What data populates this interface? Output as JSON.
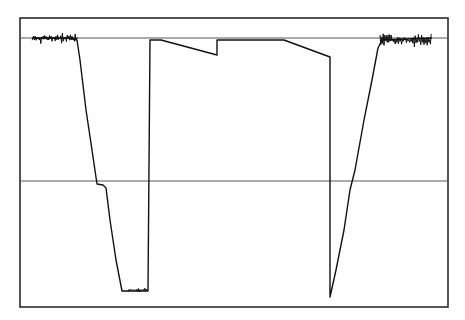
{
  "chart_data": {
    "type": "line",
    "title": "",
    "xlabel": "",
    "ylabel": "",
    "grid": false,
    "legend": null,
    "frame": {
      "left": 20,
      "top": 18,
      "right": 448,
      "bottom": 307
    },
    "reference_lines": [
      {
        "name": "upper-baseline",
        "y": 38
      },
      {
        "name": "midline",
        "y": 181
      }
    ],
    "series": [
      {
        "name": "signal-trace",
        "description": "Pixel-coordinate polyline of a waveform: noisy baseline, steep fall to minimum, jump up to plateau with two sloped steps, steep fall, then steep rise back to noisy baseline.",
        "points": [
          [
            32,
            38
          ],
          [
            70,
            38
          ],
          [
            77,
            40
          ],
          [
            80,
            60
          ],
          [
            86,
            110
          ],
          [
            92,
            150
          ],
          [
            97,
            184
          ],
          [
            103,
            185
          ],
          [
            106,
            188
          ],
          [
            110,
            220
          ],
          [
            116,
            260
          ],
          [
            122,
            291
          ],
          [
            128,
            291
          ],
          [
            148,
            291
          ],
          [
            150,
            40
          ],
          [
            161,
            40
          ],
          [
            217,
            55
          ],
          [
            217,
            40
          ],
          [
            284,
            40
          ],
          [
            330,
            57
          ],
          [
            330,
            297
          ],
          [
            336,
            270
          ],
          [
            344,
            230
          ],
          [
            350,
            190
          ],
          [
            355,
            170
          ],
          [
            364,
            120
          ],
          [
            372,
            80
          ],
          [
            378,
            48
          ],
          [
            382,
            40
          ],
          [
            432,
            38
          ]
        ]
      }
    ],
    "noise_regions": [
      {
        "name": "left-baseline-noise",
        "x_range": [
          32,
          78
        ],
        "y_center": 38,
        "amplitude": 6
      },
      {
        "name": "bottom-noise",
        "x_range": [
          128,
          148
        ],
        "y_center": 290,
        "amplitude": 3
      },
      {
        "name": "right-baseline-noise",
        "x_range": [
          380,
          432
        ],
        "y_center": 40,
        "amplitude": 8
      }
    ]
  }
}
